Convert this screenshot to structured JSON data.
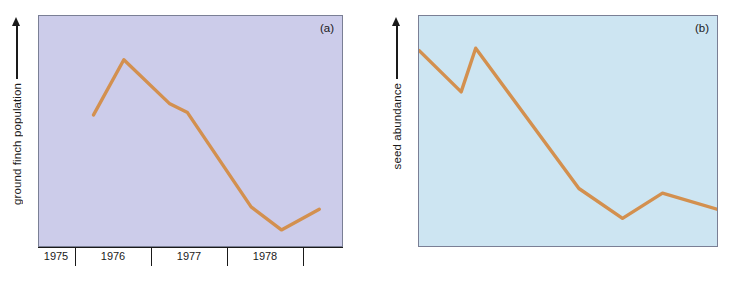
{
  "figure": {
    "background_color": "#ffffff",
    "line_color": "#d3904f",
    "axis_color": "#1a1a1a",
    "panels": [
      {
        "tag": "(a)",
        "ylabel": "ground finch population",
        "background_color": "#ccccea",
        "border_color": "#7a7f95"
      },
      {
        "tag": "(b)",
        "ylabel": "seed abundance",
        "background_color": "#cde5f2",
        "border_color": "#7a7f95"
      }
    ]
  },
  "chart_data": [
    {
      "type": "line",
      "title": "",
      "panel": "(a)",
      "xlabel": "",
      "ylabel": "ground finch population",
      "xticklabels": [
        "1975",
        "1976",
        "1977",
        "1978"
      ],
      "xlim": [
        1974.5,
        1978.5
      ],
      "ylim": [
        0,
        100
      ],
      "grid": false,
      "legend": null,
      "series": [
        {
          "name": "ground finch population",
          "color": "#d3904f",
          "x": [
            1975.22,
            1975.62,
            1976.22,
            1976.46,
            1977.3,
            1977.7,
            1978.2
          ],
          "values": [
            57,
            81,
            62,
            58,
            17,
            7,
            16
          ]
        }
      ]
    },
    {
      "type": "line",
      "title": "",
      "panel": "(b)",
      "xlabel": "",
      "ylabel": "seed abundance",
      "xticklabels": [
        "1975",
        "1976",
        "1977",
        "1978"
      ],
      "xlim": [
        1974.7,
        1978.8
      ],
      "ylim": [
        0,
        100
      ],
      "grid": false,
      "legend": null,
      "series": [
        {
          "name": "seed abundance",
          "color": "#d3904f",
          "x": [
            1974.7,
            1975.28,
            1975.48,
            1976.9,
            1977.5,
            1978.05,
            1978.8
          ],
          "values": [
            85,
            67,
            86,
            25,
            12,
            23,
            16
          ]
        }
      ]
    }
  ],
  "axis": {
    "ticks": [
      "1975",
      "1976",
      "1977",
      "1978"
    ]
  }
}
